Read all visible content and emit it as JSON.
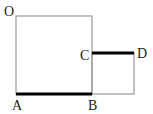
{
  "diagram": {
    "points": {
      "O": {
        "label": "O",
        "x": 16,
        "y": 16
      },
      "A": {
        "label": "A",
        "x": 16,
        "y": 94
      },
      "B": {
        "label": "B",
        "x": 92,
        "y": 94
      },
      "C": {
        "label": "C",
        "x": 92,
        "y": 53
      },
      "D": {
        "label": "D",
        "x": 134,
        "y": 53
      }
    },
    "shapes": [
      {
        "name": "large-square",
        "vertices": [
          "O",
          "A",
          "B",
          "top-right"
        ]
      },
      {
        "name": "small-square",
        "vertices": [
          "C",
          "B",
          "bottom-right",
          "D"
        ]
      }
    ],
    "highlighted_segments": [
      "AB",
      "CD"
    ],
    "colors": {
      "outline": "#999999",
      "highlight": "#000000"
    }
  }
}
